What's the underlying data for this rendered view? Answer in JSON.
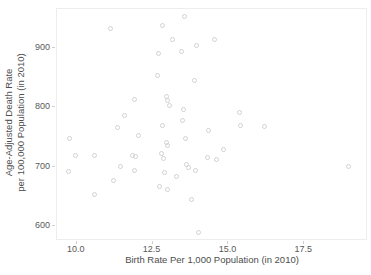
{
  "chart_data": {
    "type": "scatter",
    "title": "",
    "xlabel": "Birth Rate Per 1,000 Population (in 2010)",
    "ylabel": "Age-Adjusted Death Rate\nper 100,000 Population (in 2010)",
    "ylabel_line1": "Age-Adjusted Death Rate",
    "ylabel_line2": "per 100,000 Population (in 2010)",
    "xticks": [
      "10.0",
      "12.5",
      "15.0",
      "17.5"
    ],
    "xtick_values": [
      10.0,
      12.5,
      15.0,
      17.5
    ],
    "yticks": [
      "600",
      "700",
      "800",
      "900"
    ],
    "ytick_values": [
      600,
      700,
      800,
      900
    ],
    "xlim": [
      9.35,
      19.6
    ],
    "ylim": [
      575,
      965
    ],
    "grid": false,
    "legend": null,
    "marker": "open-circle",
    "marker_color": "#d2d2d6",
    "panel_border_color": "#ededed",
    "background": "#ffffff",
    "points": [
      [
        13.55,
        952
      ],
      [
        11.12,
        933
      ],
      [
        12.82,
        938
      ],
      [
        13.15,
        913
      ],
      [
        14.55,
        913
      ],
      [
        13.95,
        904
      ],
      [
        12.7,
        891
      ],
      [
        13.45,
        893
      ],
      [
        12.67,
        853
      ],
      [
        13.88,
        845
      ],
      [
        11.92,
        813
      ],
      [
        12.95,
        818
      ],
      [
        12.98,
        812
      ],
      [
        13.05,
        803
      ],
      [
        13.52,
        796
      ],
      [
        11.58,
        786
      ],
      [
        15.35,
        791
      ],
      [
        13.5,
        777
      ],
      [
        12.82,
        769
      ],
      [
        11.35,
        766
      ],
      [
        15.4,
        770
      ],
      [
        16.2,
        768
      ],
      [
        14.35,
        760
      ],
      [
        9.75,
        748
      ],
      [
        12.05,
        752
      ],
      [
        13.6,
        747
      ],
      [
        12.95,
        740
      ],
      [
        13.0,
        736
      ],
      [
        14.85,
        728
      ],
      [
        9.95,
        718
      ],
      [
        10.6,
        719
      ],
      [
        11.85,
        719
      ],
      [
        11.95,
        717
      ],
      [
        12.8,
        722
      ],
      [
        12.85,
        714
      ],
      [
        14.3,
        715
      ],
      [
        14.6,
        712
      ],
      [
        13.62,
        704
      ],
      [
        13.68,
        699
      ],
      [
        11.45,
        700
      ],
      [
        13.9,
        694
      ],
      [
        11.9,
        693
      ],
      [
        12.88,
        690
      ],
      [
        9.72,
        691
      ],
      [
        18.95,
        700
      ],
      [
        13.28,
        684
      ],
      [
        11.22,
        676
      ],
      [
        12.72,
        666
      ],
      [
        12.98,
        661
      ],
      [
        10.57,
        653
      ],
      [
        13.78,
        645
      ],
      [
        14.02,
        589
      ]
    ]
  }
}
